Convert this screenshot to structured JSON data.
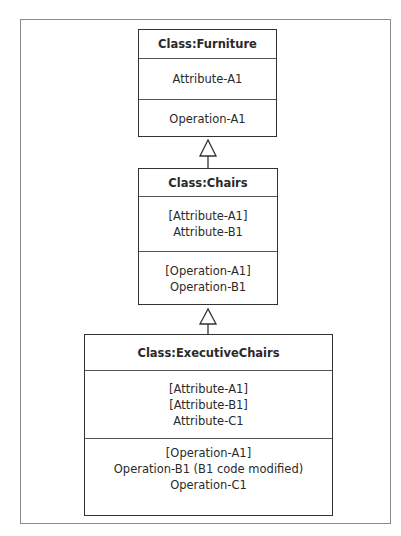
{
  "classes": [
    {
      "name": "Class:Furniture",
      "attributes": [
        "Attribute-A1"
      ],
      "operations": [
        "Operation-A1"
      ]
    },
    {
      "name": "Class:Chairs",
      "attributes": [
        "[Attribute-A1]",
        "Attribute-B1"
      ],
      "operations": [
        "[Operation-A1]",
        "Operation-B1"
      ]
    },
    {
      "name": "Class:ExecutiveChairs",
      "attributes": [
        "[Attribute-A1]",
        "[Attribute-B1]",
        "Attribute-C1"
      ],
      "operations": [
        "[Operation-A1]",
        "Operation-B1 (B1 code modified)",
        "Operation-C1"
      ]
    }
  ],
  "relationships": [
    {
      "type": "generalization",
      "from": "Class:Chairs",
      "to": "Class:Furniture"
    },
    {
      "type": "generalization",
      "from": "Class:ExecutiveChairs",
      "to": "Class:Chairs"
    }
  ]
}
